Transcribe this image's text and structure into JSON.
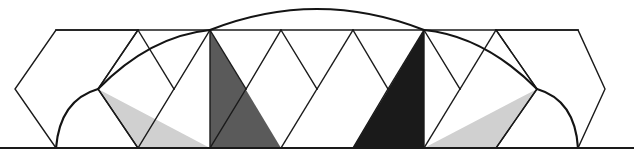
{
  "figure": {
    "width": 634,
    "height": 158,
    "background_color": "#ffffff",
    "baseline_y": 148,
    "top_line_y": 30,
    "line_color": "#1a1a1a",
    "arc_color": "#141414",
    "center_x": 317
  },
  "colors": {
    "light_gray": "#d0d0d0",
    "medium_gray": "#5a5a5a",
    "dark_gray": "#1a1a1a",
    "white": "#ffffff",
    "stroke": "#1a1a1a"
  },
  "geometry": {
    "unit_half_width": 37,
    "lattice_x": [
      15,
      56,
      98,
      138,
      174,
      210,
      246,
      281,
      317,
      353,
      388,
      424,
      460,
      496,
      537,
      578,
      605
    ],
    "apex_left_x": 210,
    "apex_right_x": 424,
    "mid_y": 89
  },
  "shaded_triangles": [
    {
      "name": "left-light-triangle",
      "fill": "#d0d0d0",
      "points": "98,89 138,148 210,148"
    },
    {
      "name": "left-medium-triangle",
      "fill": "#5a5a5a",
      "points": "210,30 210,148 281,148"
    },
    {
      "name": "right-dark-triangle",
      "fill": "#1a1a1a",
      "points": "424,30 424,148 353,148"
    },
    {
      "name": "right-light-triangle",
      "fill": "#d0d0d0",
      "points": "537,89 496,148 424,148"
    }
  ],
  "arcs": [
    {
      "name": "left-small-arc",
      "description": "arc from baseline up to left mid vertex",
      "path": "M 56,148 Q 60,100 98,89"
    },
    {
      "name": "left-long-arc",
      "description": "long arc from left mid vertex sweeping right to top apex region",
      "path": "M 98,89 Q 150,36 210,30"
    },
    {
      "name": "central-big-arc",
      "description": "large arc spanning between the two apexes peaking above top line",
      "path": "M 210,30 Q 317,-12 424,30"
    },
    {
      "name": "right-long-arc",
      "description": "long arc descending from right apex to right mid vertex",
      "path": "M 424,30 Q 484,36 537,89"
    },
    {
      "name": "right-small-arc",
      "description": "arc from right mid vertex down to baseline",
      "path": "M 537,89 Q 575,100 578,148"
    }
  ],
  "polyline_outlines": [
    {
      "name": "left-hexagon",
      "points": "56,30 15,89 56,148 138,148 98,89 138,30 56,30"
    },
    {
      "name": "top-edge",
      "points": "56,30 578,30"
    },
    {
      "name": "right-hexagon",
      "points": "578,30 496,30 537,89 496,148 578,148 605,89 578,30"
    }
  ],
  "zigzag_lines": [
    {
      "name": "zig-1",
      "points": "98,89 138,148"
    },
    {
      "name": "zig-2",
      "points": "138,30 98,89"
    },
    {
      "name": "zig-3",
      "points": "138,30 174,89"
    },
    {
      "name": "zig-4",
      "points": "174,89 138,148"
    },
    {
      "name": "zig-5",
      "points": "174,89 210,30"
    },
    {
      "name": "zig-6",
      "points": "210,30 246,89"
    },
    {
      "name": "zig-7",
      "points": "246,89 210,148"
    },
    {
      "name": "zig-8",
      "points": "246,89 281,30"
    },
    {
      "name": "zig-9",
      "points": "281,30 317,89"
    },
    {
      "name": "zig-10",
      "points": "317,89 281,148"
    },
    {
      "name": "zig-11",
      "points": "317,89 353,30"
    },
    {
      "name": "zig-12",
      "points": "353,30 388,89"
    },
    {
      "name": "zig-13",
      "points": "388,89 353,148"
    },
    {
      "name": "zig-14",
      "points": "388,89 424,30"
    },
    {
      "name": "zig-15",
      "points": "424,30 460,89"
    },
    {
      "name": "zig-16",
      "points": "460,89 424,148"
    },
    {
      "name": "zig-17",
      "points": "460,89 496,30"
    },
    {
      "name": "zig-18",
      "points": "496,30 537,89"
    },
    {
      "name": "zig-19",
      "points": "537,89 496,148"
    },
    {
      "name": "vert-left-apex",
      "points": "210,30 210,148"
    },
    {
      "name": "vert-right-apex",
      "points": "424,30 424,148"
    }
  ],
  "baseline": {
    "name": "baseline",
    "points": "0,148 634,148"
  }
}
